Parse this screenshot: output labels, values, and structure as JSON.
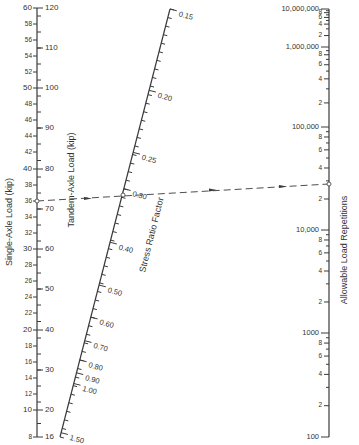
{
  "colors": {
    "ink": "#3a3a3a",
    "background": "#ffffff"
  },
  "axes": {
    "single_axle": {
      "label": "Single-Axle Load (kip)",
      "major_ticks": [
        {
          "value": "60",
          "y": 8
        },
        {
          "value": "58",
          "y": 24
        },
        {
          "value": "56",
          "y": 40
        },
        {
          "value": "54",
          "y": 56
        },
        {
          "value": "52",
          "y": 72
        },
        {
          "value": "50",
          "y": 88
        },
        {
          "value": "48",
          "y": 104
        },
        {
          "value": "46",
          "y": 120
        },
        {
          "value": "44",
          "y": 136
        },
        {
          "value": "42",
          "y": 152
        },
        {
          "value": "40",
          "y": 169
        },
        {
          "value": "38",
          "y": 185
        },
        {
          "value": "36",
          "y": 201
        },
        {
          "value": "34",
          "y": 217
        },
        {
          "value": "32",
          "y": 233
        },
        {
          "value": "30",
          "y": 249
        },
        {
          "value": "28",
          "y": 265
        },
        {
          "value": "26",
          "y": 281
        },
        {
          "value": "24",
          "y": 297
        },
        {
          "value": "22",
          "y": 313
        },
        {
          "value": "20",
          "y": 330
        },
        {
          "value": "18",
          "y": 346
        },
        {
          "value": "16",
          "y": 362
        },
        {
          "value": "14",
          "y": 378
        },
        {
          "value": "12",
          "y": 394
        },
        {
          "value": "10",
          "y": 410
        },
        {
          "value": "8",
          "y": 437
        }
      ]
    },
    "tandem_axle": {
      "label": "Tandem-Axle Load (kip)",
      "major_ticks": [
        {
          "value": "120",
          "y": 8
        },
        {
          "value": "110",
          "y": 48
        },
        {
          "value": "100",
          "y": 88
        },
        {
          "value": "90",
          "y": 128
        },
        {
          "value": "80",
          "y": 169
        },
        {
          "value": "70",
          "y": 209
        },
        {
          "value": "60",
          "y": 249
        },
        {
          "value": "50",
          "y": 289
        },
        {
          "value": "40",
          "y": 330
        },
        {
          "value": "30",
          "y": 370
        },
        {
          "value": "20",
          "y": 410
        },
        {
          "value": "16",
          "y": 437
        }
      ]
    },
    "stress_ratio": {
      "label": "Stress Ratio Factor",
      "start": {
        "x": 170,
        "y": 9
      },
      "end": {
        "x": 60,
        "y": 437
      },
      "labeled_ticks": [
        {
          "value": "0.15",
          "t": 0.0
        },
        {
          "value": "0.20",
          "t": 0.19
        },
        {
          "value": "0.25",
          "t": 0.335
        },
        {
          "value": "0.30",
          "t": 0.42
        },
        {
          "value": "0.40",
          "t": 0.545
        },
        {
          "value": "0.50",
          "t": 0.645
        },
        {
          "value": "0.60",
          "t": 0.72
        },
        {
          "value": "0.70",
          "t": 0.775
        },
        {
          "value": "0.80",
          "t": 0.82
        },
        {
          "value": "0.90",
          "t": 0.85
        },
        {
          "value": "1.00",
          "t": 0.875
        },
        {
          "value": "1.50",
          "t": 0.99
        }
      ]
    },
    "repetitions": {
      "label": "Allowable Load Repetitions",
      "decades": [
        {
          "value": "10,000,000",
          "y": 9
        },
        {
          "value": "1,000,000",
          "y": 47
        },
        {
          "value": "100,000",
          "y": 127
        },
        {
          "value": "10,000",
          "y": 230
        },
        {
          "value": "1000",
          "y": 333
        },
        {
          "value": "100",
          "y": 437
        }
      ],
      "minor_labels": [
        "8",
        "6",
        "4",
        "2"
      ]
    }
  },
  "example_line": {
    "from": {
      "x": 37,
      "y": 201,
      "label": "36 kip"
    },
    "pivot": {
      "x": 123,
      "y": 195,
      "label": "0.30"
    },
    "to": {
      "x": 329,
      "y": 184,
      "label": "≈250,000"
    }
  }
}
